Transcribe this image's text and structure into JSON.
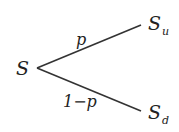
{
  "diagram": {
    "type": "binomial-tree",
    "root": {
      "symbol": "S",
      "label": "S"
    },
    "nodes": [
      {
        "id": "up",
        "base": "S",
        "subscript": "u"
      },
      {
        "id": "down",
        "base": "S",
        "subscript": "d"
      }
    ],
    "edges": [
      {
        "from": "S",
        "to": "up",
        "label": "p"
      },
      {
        "from": "S",
        "to": "down",
        "label": "1−p"
      }
    ],
    "colors": {
      "line": "#333333",
      "text": "#222222",
      "background": "#ffffff"
    }
  }
}
